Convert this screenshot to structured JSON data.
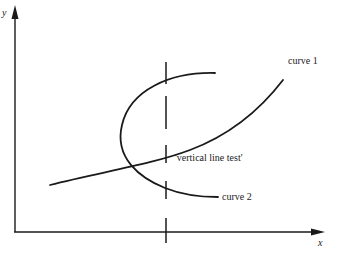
{
  "diagram": {
    "title": "",
    "axes": {
      "x_label": "x",
      "y_label": "y"
    },
    "curves": [
      {
        "id": "curve1",
        "label": "curve 1",
        "description": "monotonically increasing curve from lower-left to upper-right"
      },
      {
        "id": "curve2",
        "label": "curve 2",
        "description": "sideways parabola-like curve opening to the right; fails vertical line test"
      }
    ],
    "annotation": {
      "label": "'vertical line test'",
      "description": "dashed vertical line crossing curve 2 twice and curve 1 once"
    },
    "colors": {
      "ink": "#1a1a1a",
      "background": "#ffffff"
    }
  }
}
